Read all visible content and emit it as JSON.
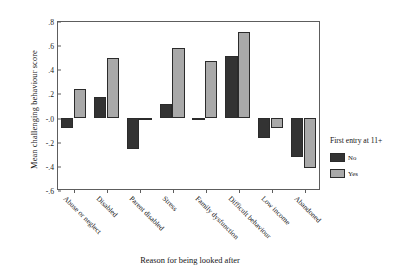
{
  "chart_data": {
    "type": "bar",
    "title": "",
    "xlabel": "Reason for being looked after",
    "ylabel": "Mean challenging behaviour score",
    "ylim": [
      -0.6,
      0.8
    ],
    "yticks": [
      0.8,
      0.6,
      0.4,
      0.2,
      0.0,
      -0.2,
      -0.4,
      -0.6
    ],
    "ytick_labels": [
      ".8",
      ".6",
      ".4",
      ".2",
      "-.0",
      "-.2",
      "-.4",
      "-.6"
    ],
    "grid": false,
    "legend_position": "right",
    "legend_title": "First entry at 11+",
    "categories": [
      "Abuse or neglect",
      "Disabled",
      "Parent disabled",
      "Stress",
      "Family dysfunction",
      "Difficult behaviour",
      "Low income",
      "Abandoned"
    ],
    "series": [
      {
        "name": "No",
        "color": "#333333",
        "values": [
          -0.09,
          0.17,
          -0.26,
          0.11,
          -0.02,
          0.51,
          -0.17,
          -0.33
        ]
      },
      {
        "name": "Yes",
        "color": "#a9a9a9",
        "values": [
          0.24,
          0.49,
          -0.02,
          0.58,
          0.47,
          0.71,
          -0.09,
          -0.42
        ]
      }
    ]
  },
  "legend": {
    "title": "First entry at 11+",
    "entries": [
      {
        "label": "No",
        "color": "#333333"
      },
      {
        "label": "Yes",
        "color": "#a9a9a9"
      }
    ]
  }
}
